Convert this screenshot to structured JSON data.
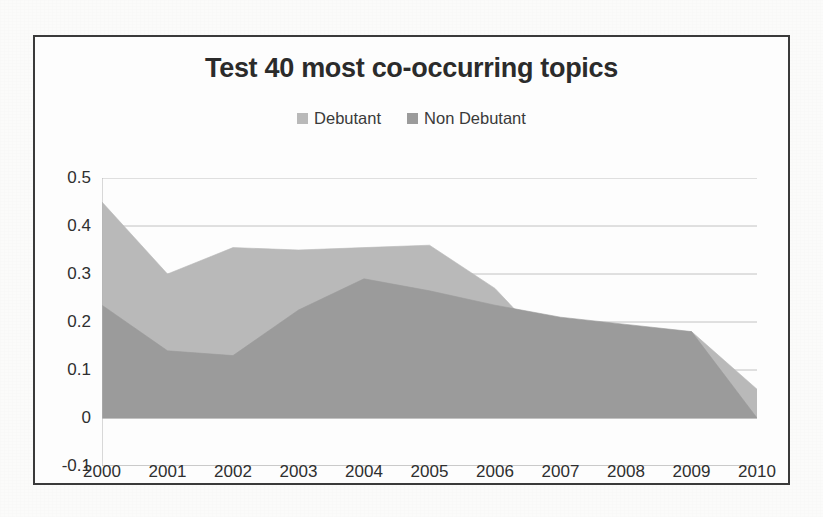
{
  "chart_data": {
    "type": "area",
    "title": "Test 40 most co-occurring topics",
    "xlabel": "",
    "ylabel": "",
    "grid": true,
    "legend_position": "top",
    "categories": [
      "2000",
      "2001",
      "2002",
      "2003",
      "2004",
      "2005",
      "2006",
      "2007",
      "2008",
      "2009",
      "2010"
    ],
    "x": [
      2000,
      2001,
      2002,
      2003,
      2004,
      2005,
      2006,
      2007,
      2008,
      2009,
      2010
    ],
    "ylim": [
      -0.1,
      0.5
    ],
    "ytick_labels": [
      "0.5",
      "0.4",
      "0.3",
      "0.2",
      "0.1",
      "0",
      "-0.1"
    ],
    "ytick_values": [
      0.5,
      0.4,
      0.3,
      0.2,
      0.1,
      0,
      -0.1
    ],
    "series": [
      {
        "name": "Debutant",
        "color": "#b9b9b9",
        "values": [
          0.45,
          0.3,
          0.355,
          0.35,
          0.355,
          0.36,
          0.27,
          0.125,
          0.155,
          0.18,
          0.06
        ]
      },
      {
        "name": "Non Debutant",
        "color": "#9b9b9b",
        "values": [
          0.235,
          0.14,
          0.13,
          0.225,
          0.29,
          0.265,
          0.235,
          0.21,
          0.195,
          0.18,
          0.0
        ]
      }
    ]
  },
  "chart": {
    "title": "Test 40 most co-occurring topics",
    "legend": [
      {
        "label": "Debutant",
        "color": "#b9b9b9"
      },
      {
        "label": "Non Debutant",
        "color": "#9b9b9b"
      }
    ]
  }
}
